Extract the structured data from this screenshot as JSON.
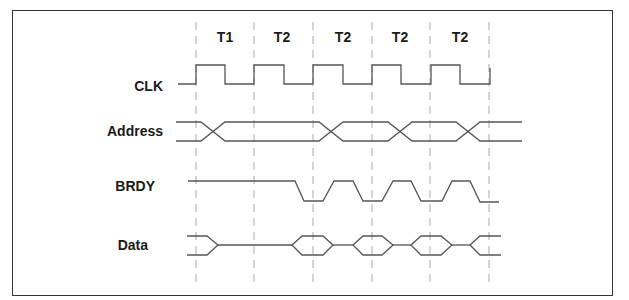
{
  "diagram": {
    "type": "timing-diagram",
    "clock_states": [
      "T1",
      "T2",
      "T2",
      "T2",
      "T2"
    ],
    "signals": [
      {
        "name": "CLK"
      },
      {
        "name": "Address"
      },
      {
        "name": "BRDY"
      },
      {
        "name": "Data"
      }
    ]
  }
}
